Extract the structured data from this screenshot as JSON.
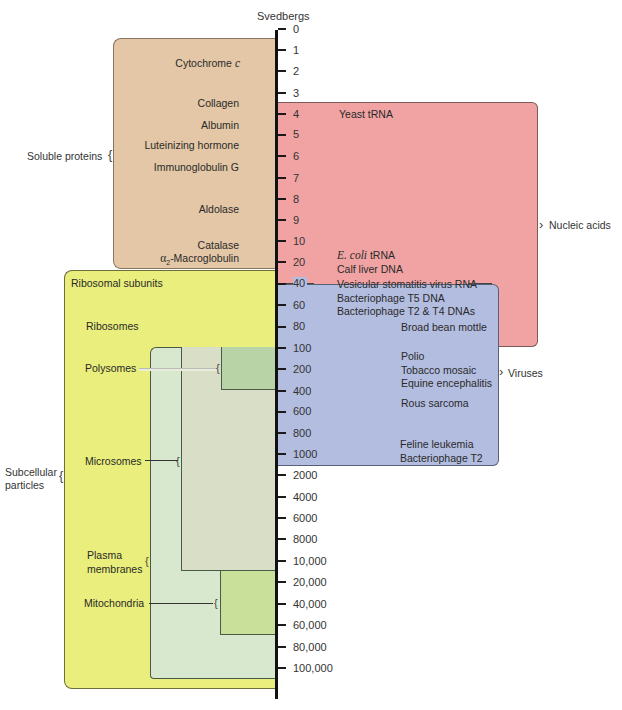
{
  "axis": {
    "title": "Svedbergs",
    "ticks": [
      "0",
      "1",
      "2",
      "3",
      "4",
      "5",
      "6",
      "7",
      "8",
      "9",
      "10",
      "20",
      "40",
      "60",
      "80",
      "100",
      "200",
      "400",
      "600",
      "800",
      "1000",
      "2000",
      "4000",
      "6000",
      "8000",
      "10,000",
      "20,000",
      "40,000",
      "60,000",
      "80,000",
      "100,000"
    ]
  },
  "groups": {
    "soluble_proteins": {
      "label": "Soluble proteins",
      "color": "#e3c7a6",
      "items": {
        "cytochrome": "Cytochrome",
        "cytochrome_suffix": "c",
        "collagen": "Collagen",
        "albumin": "Albumin",
        "luteinizing": "Luteinizing hormone",
        "immunoglobulin": "Immunoglobulin G",
        "aldolase": "Aldolase",
        "catalase": "Catalase",
        "alpha2": "α",
        "alpha2_sub": "2",
        "macroglobulin": "-Macroglobulin"
      }
    },
    "nucleic_acids": {
      "label": "Nucleic acids",
      "color": "#f0a3a2",
      "items": {
        "yeast_trna": "Yeast tRNA",
        "ecoli": "E. coli",
        "ecoli_trna": "tRNA",
        "calf_liver": "Calf liver DNA",
        "vsv_rna": "Vesicular stomatitis virus RNA",
        "t5_dna": "Bacteriophage T5 DNA",
        "t2t4_dna": "Bacteriophage T2 & T4 DNAs"
      }
    },
    "viruses": {
      "label": "Viruses",
      "color": "#b3bde0",
      "items": {
        "broad_bean": "Broad bean mottle",
        "polio": "Polio",
        "tobacco": "Tobacco mosaic",
        "equine": "Equine encephalitis",
        "rous": "Rous sarcoma",
        "feline": "Feline leukemia",
        "t2": "Bacteriophage T2"
      }
    },
    "subcellular_particles": {
      "label_line1": "Subcellular",
      "label_line2": "particles",
      "color": "#e9ee7c",
      "items": {
        "ribosomal_subunits": "Ribosomal subunits",
        "ribosomes": "Ribosomes",
        "polysomes": "Polysomes",
        "microsomes": "Microsomes",
        "plasma_line1": "Plasma",
        "plasma_line2": "membranes",
        "mitochondria": "Mitochondria"
      },
      "sub_colors": {
        "plasma": "#d8e8cf",
        "microsomes": "#d9dfc6",
        "polysomes": "#b8d4a6",
        "mitochondria": "#c9e09a"
      }
    }
  }
}
